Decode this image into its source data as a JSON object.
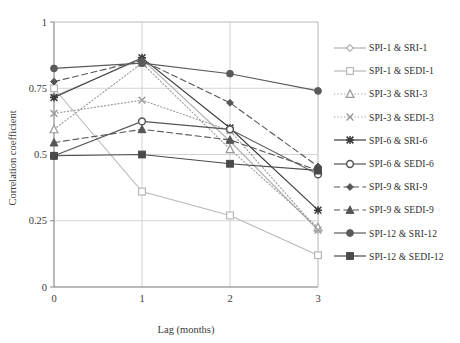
{
  "chart_data": {
    "type": "line",
    "title": "",
    "xlabel": "Lag (months)",
    "ylabel": "Correlation coefficient",
    "x": [
      0,
      1,
      2,
      3
    ],
    "xtick_labels": [
      "0",
      "1",
      "2",
      "3"
    ],
    "ytick_labels": [
      "0",
      "0.25",
      "0.5",
      "0.75",
      "1"
    ],
    "ytick_values": [
      0,
      0.25,
      0.5,
      0.75,
      1
    ],
    "xlim": [
      0,
      3
    ],
    "ylim": [
      0,
      1
    ],
    "grid": true,
    "legend_position": "right",
    "series": [
      {
        "name": "SPI-1 & SRI-1",
        "values": [
          0.72,
          0.86,
          0.55,
          0.215
        ],
        "color": "#b0b0b0",
        "marker": "diamond",
        "dash": "solid"
      },
      {
        "name": "SPI-1 & SEDI-1",
        "values": [
          0.75,
          0.36,
          0.27,
          0.12
        ],
        "color": "#b8b8b8",
        "marker": "square-open",
        "dash": "solid"
      },
      {
        "name": "SPI-3 & SRI-3",
        "values": [
          0.595,
          0.845,
          0.52,
          0.225
        ],
        "color": "#9a9a9a",
        "marker": "triangle-open",
        "dash": "dotted"
      },
      {
        "name": "SPI-3 & SEDI-3",
        "values": [
          0.655,
          0.705,
          0.59,
          0.215
        ],
        "color": "#9a9a9a",
        "marker": "cross-x",
        "dash": "dotted"
      },
      {
        "name": "SPI-6 & SRI-6",
        "values": [
          0.715,
          0.865,
          0.6,
          0.29
        ],
        "color": "#3a3a3a",
        "marker": "asterisk",
        "dash": "solid"
      },
      {
        "name": "SPI-6 & SEDI-6",
        "values": [
          0.495,
          0.625,
          0.595,
          0.425
        ],
        "color": "#555555",
        "marker": "circle-open",
        "dash": "solid"
      },
      {
        "name": "SPI-9 & SRI-9",
        "values": [
          0.775,
          0.855,
          0.695,
          0.455
        ],
        "color": "#555555",
        "marker": "diamond-filled",
        "dash": "dashed"
      },
      {
        "name": "SPI-9 & SEDI-9",
        "values": [
          0.545,
          0.595,
          0.555,
          0.44
        ],
        "color": "#555555",
        "marker": "triangle-filled",
        "dash": "dashed"
      },
      {
        "name": "SPI-12 & SRI-12",
        "values": [
          0.825,
          0.845,
          0.805,
          0.74
        ],
        "color": "#5a5a5a",
        "marker": "circle-filled",
        "dash": "solid"
      },
      {
        "name": "SPI-12 & SEDI-12",
        "values": [
          0.495,
          0.5,
          0.465,
          0.44
        ],
        "color": "#4a4a4a",
        "marker": "square-filled",
        "dash": "solid"
      }
    ]
  },
  "axes": {
    "ylabel": "Correlation coefficient",
    "xlabel": "Lag (months)",
    "y_ticks": [
      "1",
      "0.75",
      "0.5",
      "0.25",
      "0"
    ],
    "x_ticks": [
      "0",
      "1",
      "2",
      "3"
    ]
  },
  "legend": {
    "items": [
      {
        "label": "SPI-1 & SRI-1"
      },
      {
        "label": "SPI-1 & SEDI-1"
      },
      {
        "label": "SPI-3 & SRI-3"
      },
      {
        "label": "SPI-3 & SEDI-3"
      },
      {
        "label": "SPI-6 & SRI-6"
      },
      {
        "label": "SPI-6 & SEDI-6"
      },
      {
        "label": "SPI-9 & SRI-9"
      },
      {
        "label": "SPI-9 & SEDI-9"
      },
      {
        "label": "SPI-12 & SRI-12"
      },
      {
        "label": "SPI-12 & SEDI-12"
      }
    ]
  },
  "colors": {
    "grid": "#c9c9c9",
    "axis": "#8a8a8a",
    "text": "#3a3a3a"
  }
}
